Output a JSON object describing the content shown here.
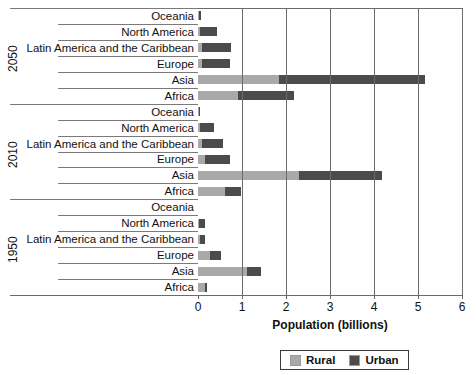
{
  "chart_data": {
    "type": "bar",
    "orientation": "horizontal",
    "stacked": true,
    "title": "",
    "xlabel": "Population (billions)",
    "ylabel": "",
    "xlim": [
      0,
      6
    ],
    "xticks": [
      0,
      1,
      2,
      3,
      4,
      5,
      6
    ],
    "xticklabels": [
      "0",
      "1",
      "2",
      "3",
      "4",
      "5",
      "6"
    ],
    "grid": "vertical",
    "legend": {
      "position": "bottom",
      "entries": [
        "Rural",
        "Urban"
      ]
    },
    "series": [
      {
        "name": "Rural",
        "color": "#a9a9a9"
      },
      {
        "name": "Urban",
        "color": "#4b4b4b"
      }
    ],
    "groups": [
      {
        "label": "2050",
        "categories": [
          "Oceania",
          "North America",
          "Latin America and the Caribbean",
          "Europe",
          "Asia",
          "Africa"
        ],
        "rural": [
          0.02,
          0.05,
          0.08,
          0.1,
          1.85,
          0.9
        ],
        "urban": [
          0.04,
          0.38,
          0.66,
          0.63,
          3.3,
          1.28
        ]
      },
      {
        "label": "2010",
        "categories": [
          "Oceania",
          "North America",
          "Latin America and the Caribbean",
          "Europe",
          "Asia",
          "Africa"
        ],
        "rural": [
          0.02,
          0.04,
          0.08,
          0.15,
          2.3,
          0.62
        ],
        "urban": [
          0.02,
          0.33,
          0.49,
          0.58,
          1.88,
          0.36
        ]
      },
      {
        "label": "1950",
        "categories": [
          "Oceania",
          "North America",
          "Latin America and the Caribbean",
          "Europe",
          "Asia",
          "Africa"
        ],
        "rural": [
          0.0,
          0.02,
          0.04,
          0.28,
          1.11,
          0.17
        ],
        "urban": [
          0.0,
          0.13,
          0.11,
          0.25,
          0.32,
          0.03
        ]
      }
    ]
  },
  "axis": {
    "x_title": "Population (billions)",
    "ticks": [
      "0",
      "1",
      "2",
      "3",
      "4",
      "5",
      "6"
    ]
  },
  "legend": {
    "rural_label": "Rural",
    "urban_label": "Urban"
  },
  "colors": {
    "rural": "#a9a9a9",
    "urban": "#4b4b4b",
    "axis": "#6a6a6a",
    "text": "#111111",
    "background": "#ffffff"
  }
}
